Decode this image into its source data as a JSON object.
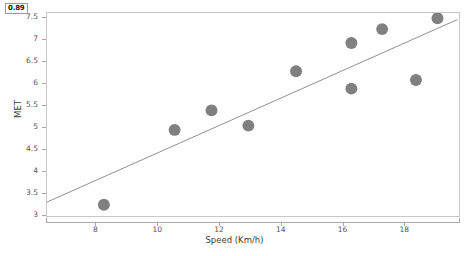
{
  "chart_data": {
    "type": "scatter",
    "title": "",
    "xlabel": "Speed (Km/h)",
    "ylabel": "MET",
    "xlim": [
      6.4,
      19.8
    ],
    "ylim": [
      2.95,
      7.62
    ],
    "grid": false,
    "legend": null,
    "annotation": "0.89",
    "point_color": "#808080",
    "line_color": "#909090",
    "axis_color": "#a8a8a8",
    "tick_text_color": "#555555",
    "series": [
      {
        "name": "observations",
        "marker": "circle",
        "x": [
          8.25,
          10.55,
          11.75,
          12.95,
          14.5,
          16.3,
          16.3,
          17.3,
          18.4,
          19.1
        ],
        "y": [
          3.21,
          4.93,
          5.38,
          5.03,
          6.28,
          5.88,
          6.93,
          7.25,
          6.08,
          7.5
        ]
      },
      {
        "name": "regression-line",
        "marker": "line",
        "x": [
          6.4,
          19.75
        ],
        "y": [
          3.27,
          7.47
        ]
      }
    ],
    "xticks": [
      8,
      10,
      12,
      14,
      16,
      18
    ],
    "xtick_labels": [
      "8",
      "10",
      "12",
      "14",
      "16",
      "18"
    ],
    "yticks": [
      3,
      3.5,
      4,
      4.5,
      5,
      5.5,
      6,
      6.5,
      7,
      7.5
    ],
    "ytick_labels": [
      "3",
      "3.5",
      "4",
      "4.5",
      "5",
      "5.5",
      "6",
      "6.5",
      "7",
      "7.5"
    ]
  }
}
